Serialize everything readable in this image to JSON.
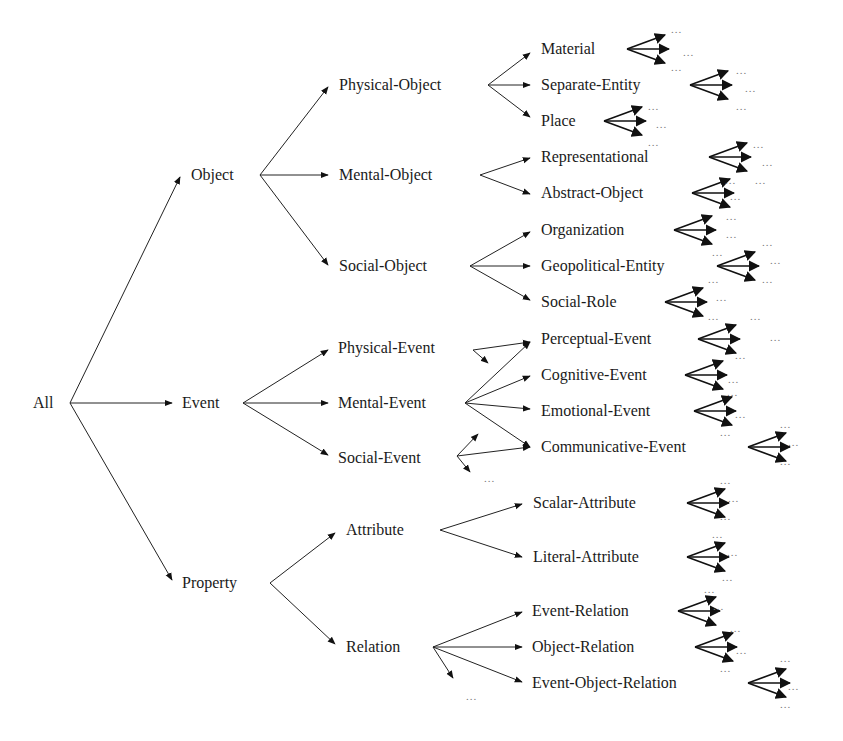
{
  "diagram": {
    "title": "",
    "type": "taxonomy-tree",
    "ellipsis": "...",
    "nodes": [
      {
        "id": "all",
        "label": "All",
        "x": 33,
        "y": 403
      },
      {
        "id": "object",
        "label": "Object",
        "x": 191,
        "y": 175
      },
      {
        "id": "event",
        "label": "Event",
        "x": 182,
        "y": 403
      },
      {
        "id": "property",
        "label": "Property",
        "x": 182,
        "y": 583
      },
      {
        "id": "physical-object",
        "label": "Physical-Object",
        "x": 339,
        "y": 85
      },
      {
        "id": "mental-object",
        "label": "Mental-Object",
        "x": 339,
        "y": 175
      },
      {
        "id": "social-object",
        "label": "Social-Object",
        "x": 339,
        "y": 266
      },
      {
        "id": "physical-event",
        "label": "Physical-Event",
        "x": 338,
        "y": 348
      },
      {
        "id": "mental-event",
        "label": "Mental-Event",
        "x": 338,
        "y": 403
      },
      {
        "id": "social-event",
        "label": "Social-Event",
        "x": 338,
        "y": 458
      },
      {
        "id": "attribute",
        "label": "Attribute",
        "x": 346,
        "y": 530
      },
      {
        "id": "relation",
        "label": "Relation",
        "x": 346,
        "y": 647
      },
      {
        "id": "material",
        "label": "Material",
        "x": 541,
        "y": 49
      },
      {
        "id": "separate-entity",
        "label": "Separate-Entity",
        "x": 541,
        "y": 85
      },
      {
        "id": "place",
        "label": "Place",
        "x": 541,
        "y": 121
      },
      {
        "id": "representational",
        "label": "Representational",
        "x": 541,
        "y": 157
      },
      {
        "id": "abstract-object",
        "label": "Abstract-Object",
        "x": 541,
        "y": 193
      },
      {
        "id": "organization",
        "label": "Organization",
        "x": 541,
        "y": 230
      },
      {
        "id": "geopolitical-entity",
        "label": "Geopolitical-Entity",
        "x": 541,
        "y": 266
      },
      {
        "id": "social-role",
        "label": "Social-Role",
        "x": 541,
        "y": 302
      },
      {
        "id": "perceptual-event",
        "label": "Perceptual-Event",
        "x": 541,
        "y": 339
      },
      {
        "id": "cognitive-event",
        "label": "Cognitive-Event",
        "x": 541,
        "y": 375
      },
      {
        "id": "emotional-event",
        "label": "Emotional-Event",
        "x": 541,
        "y": 411
      },
      {
        "id": "communicative-event",
        "label": "Communicative-Event",
        "x": 541,
        "y": 447
      },
      {
        "id": "scalar-attribute",
        "label": "Scalar-Attribute",
        "x": 533,
        "y": 503
      },
      {
        "id": "literal-attribute",
        "label": "Literal-Attribute",
        "x": 533,
        "y": 557
      },
      {
        "id": "event-relation",
        "label": "Event-Relation",
        "x": 532,
        "y": 611
      },
      {
        "id": "object-relation",
        "label": "Object-Relation",
        "x": 532,
        "y": 647
      },
      {
        "id": "event-object-relation",
        "label": "Event-Object-Relation",
        "x": 532,
        "y": 683
      }
    ],
    "edges": [
      {
        "from": [
          70,
          403
        ],
        "to": [
          180,
          177
        ]
      },
      {
        "from": [
          70,
          403
        ],
        "to": [
          172,
          403
        ]
      },
      {
        "from": [
          70,
          403
        ],
        "to": [
          172,
          580
        ]
      },
      {
        "from": [
          260,
          175
        ],
        "to": [
          328,
          87
        ]
      },
      {
        "from": [
          260,
          175
        ],
        "to": [
          328,
          175
        ]
      },
      {
        "from": [
          260,
          175
        ],
        "to": [
          328,
          265
        ]
      },
      {
        "from": [
          243,
          403
        ],
        "to": [
          328,
          350
        ]
      },
      {
        "from": [
          243,
          403
        ],
        "to": [
          328,
          403
        ]
      },
      {
        "from": [
          243,
          403
        ],
        "to": [
          328,
          455
        ]
      },
      {
        "from": [
          270,
          583
        ],
        "to": [
          335,
          533
        ]
      },
      {
        "from": [
          270,
          583
        ],
        "to": [
          335,
          644
        ]
      },
      {
        "from": [
          488,
          85
        ],
        "to": [
          530,
          53
        ]
      },
      {
        "from": [
          488,
          85
        ],
        "to": [
          530,
          85
        ]
      },
      {
        "from": [
          488,
          85
        ],
        "to": [
          530,
          117
        ]
      },
      {
        "from": [
          480,
          175
        ],
        "to": [
          530,
          158
        ]
      },
      {
        "from": [
          480,
          175
        ],
        "to": [
          530,
          194
        ]
      },
      {
        "from": [
          470,
          266
        ],
        "to": [
          530,
          232
        ]
      },
      {
        "from": [
          470,
          266
        ],
        "to": [
          530,
          266
        ]
      },
      {
        "from": [
          470,
          266
        ],
        "to": [
          530,
          300
        ]
      },
      {
        "from": [
          473,
          350
        ],
        "to": [
          530,
          342
        ]
      },
      {
        "from": [
          473,
          350
        ],
        "to": [
          488,
          363
        ]
      },
      {
        "from": [
          465,
          403
        ],
        "to": [
          530,
          342
        ]
      },
      {
        "from": [
          465,
          403
        ],
        "to": [
          530,
          376
        ]
      },
      {
        "from": [
          465,
          403
        ],
        "to": [
          530,
          409
        ]
      },
      {
        "from": [
          465,
          403
        ],
        "to": [
          530,
          447
        ]
      },
      {
        "from": [
          457,
          456
        ],
        "to": [
          530,
          447
        ]
      },
      {
        "from": [
          457,
          456
        ],
        "to": [
          478,
          434
        ]
      },
      {
        "from": [
          457,
          456
        ],
        "to": [
          470,
          472
        ]
      },
      {
        "from": [
          440,
          530
        ],
        "to": [
          522,
          504
        ]
      },
      {
        "from": [
          440,
          530
        ],
        "to": [
          522,
          557
        ]
      },
      {
        "from": [
          433,
          647
        ],
        "to": [
          522,
          612
        ]
      },
      {
        "from": [
          433,
          647
        ],
        "to": [
          522,
          647
        ]
      },
      {
        "from": [
          433,
          647
        ],
        "to": [
          522,
          682
        ]
      },
      {
        "from": [
          433,
          647
        ],
        "to": [
          453,
          678
        ]
      }
    ],
    "leaf_fans": [
      {
        "x": 627,
        "y": 49
      },
      {
        "x": 690,
        "y": 85
      },
      {
        "x": 604,
        "y": 121
      },
      {
        "x": 709,
        "y": 157
      },
      {
        "x": 692,
        "y": 193
      },
      {
        "x": 674,
        "y": 230
      },
      {
        "x": 717,
        "y": 266
      },
      {
        "x": 665,
        "y": 302
      },
      {
        "x": 698,
        "y": 339
      },
      {
        "x": 685,
        "y": 375
      },
      {
        "x": 694,
        "y": 411
      },
      {
        "x": 748,
        "y": 447
      },
      {
        "x": 687,
        "y": 503
      },
      {
        "x": 687,
        "y": 557
      },
      {
        "x": 678,
        "y": 611
      },
      {
        "x": 695,
        "y": 647
      },
      {
        "x": 748,
        "y": 683
      }
    ],
    "ellipsis_marks": [
      {
        "x": 671,
        "y": 33
      },
      {
        "x": 683,
        "y": 56
      },
      {
        "x": 671,
        "y": 71
      },
      {
        "x": 736,
        "y": 74
      },
      {
        "x": 745,
        "y": 92
      },
      {
        "x": 736,
        "y": 110
      },
      {
        "x": 648,
        "y": 110
      },
      {
        "x": 656,
        "y": 128
      },
      {
        "x": 648,
        "y": 146
      },
      {
        "x": 753,
        "y": 148
      },
      {
        "x": 762,
        "y": 166
      },
      {
        "x": 725,
        "y": 184
      },
      {
        "x": 755,
        "y": 184
      },
      {
        "x": 730,
        "y": 200
      },
      {
        "x": 726,
        "y": 220
      },
      {
        "x": 726,
        "y": 238
      },
      {
        "x": 762,
        "y": 246
      },
      {
        "x": 770,
        "y": 264
      },
      {
        "x": 762,
        "y": 283
      },
      {
        "x": 712,
        "y": 256
      },
      {
        "x": 708,
        "y": 283
      },
      {
        "x": 716,
        "y": 301
      },
      {
        "x": 708,
        "y": 320
      },
      {
        "x": 750,
        "y": 320
      },
      {
        "x": 770,
        "y": 341
      },
      {
        "x": 735,
        "y": 359
      },
      {
        "x": 728,
        "y": 383
      },
      {
        "x": 727,
        "y": 396
      },
      {
        "x": 735,
        "y": 418
      },
      {
        "x": 720,
        "y": 436
      },
      {
        "x": 780,
        "y": 428
      },
      {
        "x": 788,
        "y": 446
      },
      {
        "x": 780,
        "y": 465
      },
      {
        "x": 484,
        "y": 482
      },
      {
        "x": 720,
        "y": 484
      },
      {
        "x": 728,
        "y": 502
      },
      {
        "x": 720,
        "y": 520
      },
      {
        "x": 712,
        "y": 538
      },
      {
        "x": 727,
        "y": 556
      },
      {
        "x": 722,
        "y": 581
      },
      {
        "x": 704,
        "y": 593
      },
      {
        "x": 713,
        "y": 610
      },
      {
        "x": 730,
        "y": 632
      },
      {
        "x": 736,
        "y": 654
      },
      {
        "x": 720,
        "y": 672
      },
      {
        "x": 780,
        "y": 662
      },
      {
        "x": 788,
        "y": 690
      },
      {
        "x": 780,
        "y": 708
      },
      {
        "x": 466,
        "y": 700
      }
    ]
  }
}
